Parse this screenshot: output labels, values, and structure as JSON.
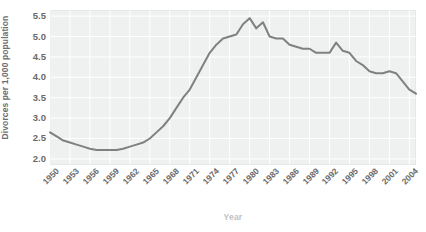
{
  "chart_data": {
    "type": "line",
    "title": "",
    "xlabel": "Year",
    "ylabel": "Divorces per 1,000 population",
    "xlim": [
      1950,
      2005
    ],
    "ylim": [
      1.85,
      5.65
    ],
    "yticks": [
      "2.0",
      "2.5",
      "3.0",
      "3.5",
      "4.0",
      "4.5",
      "5.0",
      "5.5"
    ],
    "ytick_values": [
      2.0,
      2.5,
      3.0,
      3.5,
      4.0,
      4.5,
      5.0,
      5.5
    ],
    "xticks": [
      "1950",
      "1953",
      "1956",
      "1959",
      "1962",
      "1965",
      "1968",
      "1971",
      "1974",
      "1977",
      "1980",
      "1983",
      "1986",
      "1989",
      "1992",
      "1995",
      "1998",
      "2001",
      "2004"
    ],
    "xtick_values": [
      1950,
      1953,
      1956,
      1959,
      1962,
      1965,
      1968,
      1971,
      1974,
      1977,
      1980,
      1983,
      1986,
      1989,
      1992,
      1995,
      1998,
      2001,
      2004
    ],
    "grid": true,
    "grid_color": "#ffffff",
    "legend": null,
    "line_color": "#808080",
    "plot_background": "#eff0f0",
    "figure_background": "#ffffff",
    "x": [
      1950,
      1951,
      1952,
      1953,
      1954,
      1955,
      1956,
      1957,
      1958,
      1959,
      1960,
      1961,
      1962,
      1963,
      1964,
      1965,
      1966,
      1967,
      1968,
      1969,
      1970,
      1971,
      1972,
      1973,
      1974,
      1975,
      1976,
      1977,
      1978,
      1979,
      1980,
      1981,
      1982,
      1983,
      1984,
      1985,
      1986,
      1987,
      1988,
      1989,
      1990,
      1991,
      1992,
      1993,
      1994,
      1995,
      1996,
      1997,
      1998,
      1999,
      2000,
      2001,
      2002,
      2003,
      2004,
      2005
    ],
    "values": [
      2.65,
      2.55,
      2.45,
      2.4,
      2.35,
      2.3,
      2.25,
      2.22,
      2.22,
      2.22,
      2.22,
      2.25,
      2.3,
      2.35,
      2.4,
      2.5,
      2.65,
      2.8,
      3.0,
      3.25,
      3.5,
      3.7,
      4.0,
      4.3,
      4.6,
      4.8,
      4.95,
      5.0,
      5.05,
      5.3,
      5.45,
      5.2,
      5.35,
      5.0,
      4.95,
      4.95,
      4.8,
      4.75,
      4.7,
      4.7,
      4.6,
      4.6,
      4.6,
      4.85,
      4.65,
      4.6,
      4.4,
      4.3,
      4.15,
      4.1,
      4.1,
      4.15,
      4.1,
      3.9,
      3.7,
      3.6
    ]
  }
}
